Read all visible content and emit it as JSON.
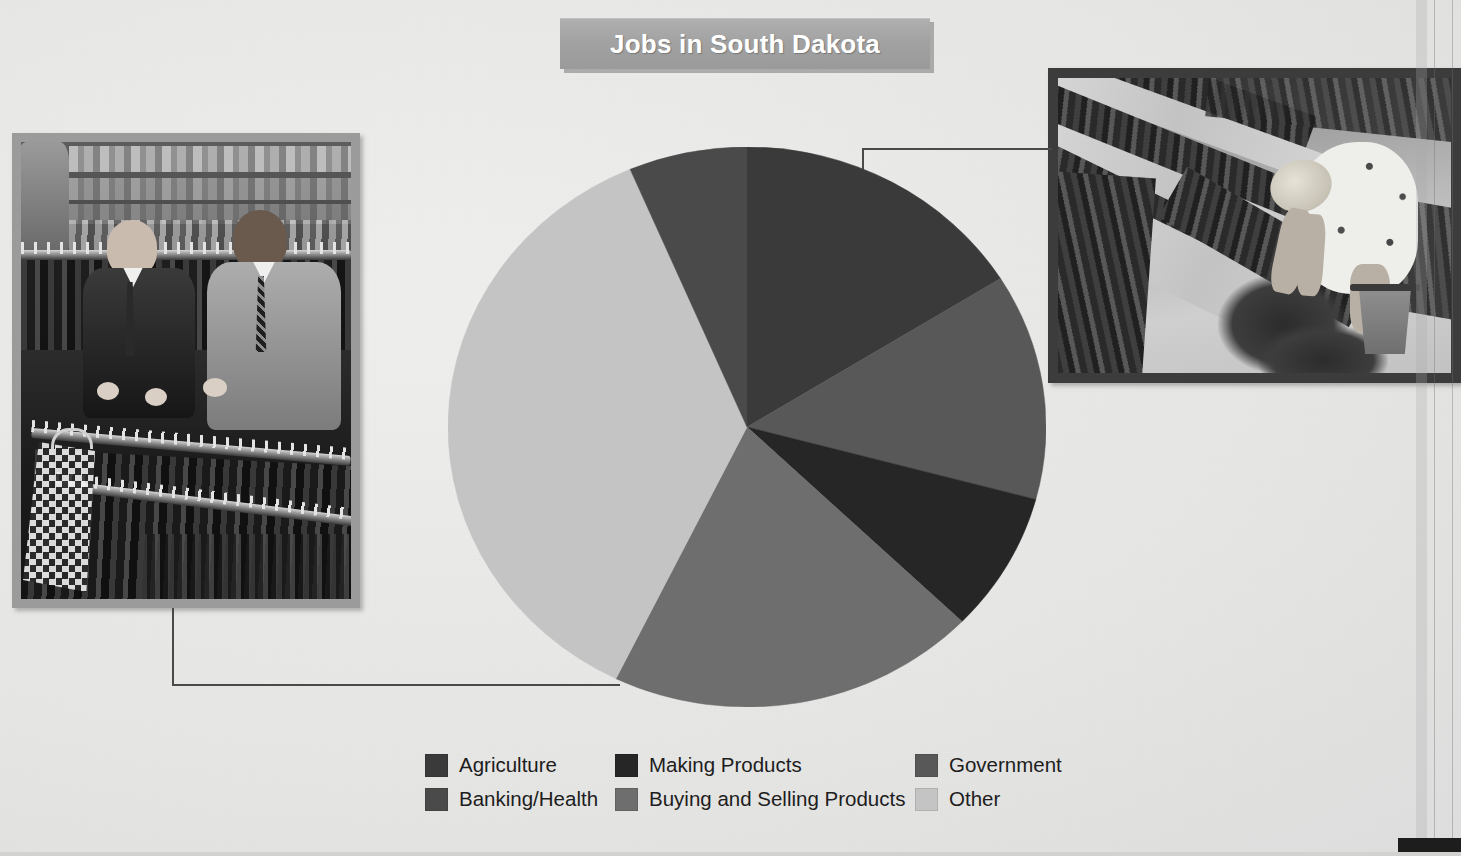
{
  "page": {
    "background_color": "#e9e9e7",
    "width": 1461,
    "height": 856
  },
  "title": {
    "text": "Jobs in South Dakota",
    "banner_color": "#a2a2a2",
    "text_color": "#ffffff"
  },
  "photos": [
    {
      "name": "clothing-store-photo",
      "caption": "Two men looking at suits on racks in a clothing store",
      "subject": "Buying and Selling Products",
      "frame_color": "#9b9b9b"
    },
    {
      "name": "farm-field-photo",
      "caption": "Woman in a sun hat bending over rows of crops with a bucket",
      "subject": "Agriculture",
      "frame_color": "#3c3c3c"
    }
  ],
  "chart_data": {
    "type": "pie",
    "title": "Jobs in South Dakota",
    "xlabel": "",
    "ylabel": "",
    "units": "percent of jobs",
    "legend_position": "bottom",
    "grid": false,
    "start_angle_deg": 0,
    "direction": "clockwise",
    "categories": [
      "Agriculture",
      "Government",
      "Making Products",
      "Buying and Selling Products",
      "Other",
      "Banking/Health"
    ],
    "values": [
      16,
      13,
      8,
      20,
      36,
      7
    ],
    "slices": [
      {
        "label": "Agriculture",
        "value": 16,
        "color": "#3a3a3a",
        "start_deg": 0,
        "end_deg": 58
      },
      {
        "label": "Government",
        "value": 13,
        "color": "#585858",
        "start_deg": 58,
        "end_deg": 105
      },
      {
        "label": "Making Products",
        "value": 8,
        "color": "#262626",
        "start_deg": 105,
        "end_deg": 134
      },
      {
        "label": "Buying and Selling Products",
        "value": 20,
        "color": "#6e6e6e",
        "start_deg": 134,
        "end_deg": 206
      },
      {
        "label": "Other",
        "value": 36,
        "color": "#c4c4c4",
        "start_deg": 206,
        "end_deg": 337
      },
      {
        "label": "Banking/Health",
        "value": 7,
        "color": "#4a4a4a",
        "start_deg": 337,
        "end_deg": 360
      }
    ]
  },
  "legend": {
    "row1": [
      {
        "label": "Agriculture",
        "color": "#3a3a3a"
      },
      {
        "label": "Making Products",
        "color": "#262626"
      },
      {
        "label": "Government",
        "color": "#585858"
      }
    ],
    "row2": [
      {
        "label": "Banking/Health",
        "color": "#4a4a4a"
      },
      {
        "label": "Buying and Selling Products",
        "color": "#6e6e6e"
      },
      {
        "label": "Other",
        "color": "#c4c4c4"
      }
    ]
  }
}
